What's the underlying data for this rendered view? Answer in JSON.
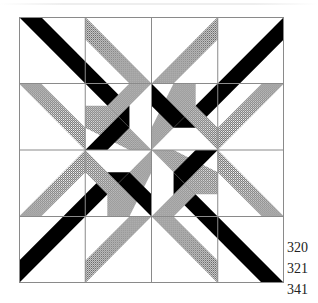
{
  "figure": {
    "type": "quilt-block-diagram",
    "grid": {
      "rows": 4,
      "cols": 4
    },
    "colors": {
      "background": "#ffffff",
      "grid_line": "#8a8a8a",
      "solid_fabric": "#000000",
      "hatched_fabric_light": "#ffffff",
      "hatched_fabric_dark": "#555555"
    },
    "pattern_description": "Four-fold rotational pinwheel of black and hatched grey diagonal strips crossing a 4x4 grid"
  },
  "labels": {
    "codes": [
      "320",
      "321",
      "341"
    ]
  }
}
